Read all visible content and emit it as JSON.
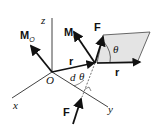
{
  "diagram": {
    "labels": {
      "z_axis": "z",
      "x_axis": "x",
      "y_axis": "y",
      "origin": "O",
      "moment_left": "M",
      "moment_left_sub": "O",
      "moment_right": "M",
      "moment_right_sub": "O",
      "force_top": "F",
      "force_bottom": "F",
      "position_left": "r",
      "position_right": "r",
      "distance": "d",
      "angle_bottom": "θ",
      "angle_top": "θ"
    },
    "colors": {
      "line": "#111111",
      "plane_fill": "#e4e4e4",
      "plane_stroke": "#444444"
    }
  }
}
